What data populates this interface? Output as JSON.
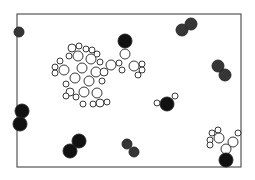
{
  "figure": {
    "frame": {
      "x": 17,
      "y": 14,
      "w": 224,
      "h": 153,
      "stroke": "#333333"
    },
    "colors": {
      "background": "#ffffff",
      "dark_atom": "#111111",
      "hatched_atom": "#2a2a2a",
      "hatch_line": "#888888",
      "light_atom_fill": "#ffffff",
      "outline": "#222222"
    },
    "molecules": [
      {
        "kind": "diatomic-hatched",
        "atoms": [
          {
            "cx": 19,
            "cy": 32,
            "r": 5
          }
        ]
      },
      {
        "kind": "diatomic-hatched",
        "atoms": [
          {
            "cx": 182,
            "cy": 30,
            "r": 6
          },
          {
            "cx": 191,
            "cy": 24,
            "r": 6
          }
        ]
      },
      {
        "kind": "diatomic-hatched",
        "atoms": [
          {
            "cx": 218,
            "cy": 66,
            "r": 6
          },
          {
            "cx": 225,
            "cy": 75,
            "r": 6
          }
        ]
      },
      {
        "kind": "diatomic-hatched",
        "atoms": [
          {
            "cx": 127,
            "cy": 144,
            "r": 5
          },
          {
            "cx": 134,
            "cy": 152,
            "r": 5
          }
        ]
      },
      {
        "kind": "diatomic-dark",
        "atoms": [
          {
            "cx": 22,
            "cy": 111,
            "r": 7
          },
          {
            "cx": 20,
            "cy": 124,
            "r": 7
          }
        ]
      },
      {
        "kind": "diatomic-dark",
        "atoms": [
          {
            "cx": 79,
            "cy": 141,
            "r": 7
          },
          {
            "cx": 70,
            "cy": 151,
            "r": 7
          }
        ]
      },
      {
        "kind": "water",
        "atoms": [
          {
            "cx": 167,
            "cy": 104,
            "r": 7,
            "dark": true
          },
          {
            "cx": 157,
            "cy": 103,
            "r": 3
          },
          {
            "cx": 175,
            "cy": 96,
            "r": 3
          }
        ]
      },
      {
        "kind": "dark-single",
        "atoms": [
          {
            "cx": 226,
            "cy": 160,
            "r": 7,
            "dark": true
          }
        ]
      },
      {
        "kind": "dark-single",
        "atoms": [
          {
            "cx": 125,
            "cy": 41,
            "r": 7,
            "dark": true
          }
        ]
      }
    ],
    "cluster_main": [
      {
        "cx": 72,
        "cy": 48,
        "r": 4
      },
      {
        "cx": 79,
        "cy": 46,
        "r": 3
      },
      {
        "cx": 86,
        "cy": 49,
        "r": 3
      },
      {
        "cx": 92,
        "cy": 50,
        "r": 3
      },
      {
        "cx": 97,
        "cy": 54,
        "r": 3
      },
      {
        "cx": 69,
        "cy": 56,
        "r": 3
      },
      {
        "cx": 78,
        "cy": 56,
        "r": 5
      },
      {
        "cx": 91,
        "cy": 59,
        "r": 5
      },
      {
        "cx": 100,
        "cy": 62,
        "r": 3
      },
      {
        "cx": 60,
        "cy": 61,
        "r": 3
      },
      {
        "cx": 55,
        "cy": 67,
        "r": 3
      },
      {
        "cx": 55,
        "cy": 73,
        "r": 3
      },
      {
        "cx": 64,
        "cy": 70,
        "r": 5
      },
      {
        "cx": 82,
        "cy": 68,
        "r": 5
      },
      {
        "cx": 96,
        "cy": 72,
        "r": 5
      },
      {
        "cx": 75,
        "cy": 78,
        "r": 5
      },
      {
        "cx": 66,
        "cy": 84,
        "r": 3
      },
      {
        "cx": 104,
        "cy": 72,
        "r": 4
      },
      {
        "cx": 89,
        "cy": 81,
        "r": 5
      },
      {
        "cx": 102,
        "cy": 81,
        "r": 3
      },
      {
        "cx": 70,
        "cy": 92,
        "r": 4
      },
      {
        "cx": 84,
        "cy": 92,
        "r": 5
      },
      {
        "cx": 76,
        "cy": 97,
        "r": 3
      },
      {
        "cx": 97,
        "cy": 93,
        "r": 5
      },
      {
        "cx": 66,
        "cy": 96,
        "r": 3
      },
      {
        "cx": 83,
        "cy": 104,
        "r": 3
      },
      {
        "cx": 100,
        "cy": 103,
        "r": 4
      },
      {
        "cx": 93,
        "cy": 104,
        "r": 3
      },
      {
        "cx": 107,
        "cy": 102,
        "r": 3
      },
      {
        "cx": 111,
        "cy": 65,
        "r": 5
      },
      {
        "cx": 119,
        "cy": 63,
        "r": 3
      },
      {
        "cx": 125,
        "cy": 54,
        "r": 5
      },
      {
        "cx": 122,
        "cy": 70,
        "r": 3
      },
      {
        "cx": 134,
        "cy": 66,
        "r": 5
      },
      {
        "cx": 142,
        "cy": 64,
        "r": 3
      },
      {
        "cx": 142,
        "cy": 70,
        "r": 3
      },
      {
        "cx": 138,
        "cy": 75,
        "r": 3
      }
    ],
    "cluster_corner": [
      {
        "cx": 212,
        "cy": 133,
        "r": 3
      },
      {
        "cx": 218,
        "cy": 130,
        "r": 3
      },
      {
        "cx": 210,
        "cy": 140,
        "r": 3
      },
      {
        "cx": 219,
        "cy": 138,
        "r": 5
      },
      {
        "cx": 210,
        "cy": 145,
        "r": 3
      },
      {
        "cx": 233,
        "cy": 142,
        "r": 5
      },
      {
        "cx": 238,
        "cy": 133,
        "r": 3
      },
      {
        "cx": 226,
        "cy": 149,
        "r": 5
      }
    ]
  }
}
